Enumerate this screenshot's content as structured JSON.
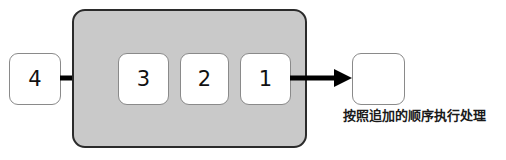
{
  "diagram": {
    "colors": {
      "container_fill": "#c9c9c9",
      "container_border": "#2b2b2b",
      "box_fill": "#ffffff",
      "box_border": "#8a8a8a",
      "arrow": "#000000",
      "text": "#1a1a1a"
    },
    "incoming": {
      "label": "4"
    },
    "queue": {
      "items": [
        {
          "label": "3"
        },
        {
          "label": "2"
        },
        {
          "label": "1"
        }
      ]
    },
    "outgoing": {
      "label": ""
    },
    "arrows": [
      {
        "name": "enqueue-arrow",
        "direction": "right"
      },
      {
        "name": "dequeue-arrow",
        "direction": "right"
      }
    ],
    "caption": "按照追加的顺序执行处理"
  }
}
